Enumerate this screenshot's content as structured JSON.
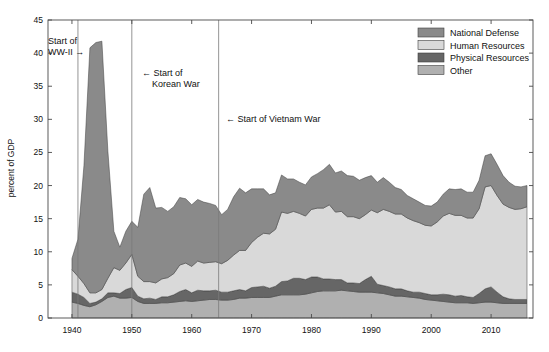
{
  "chart_data": {
    "type": "area",
    "stacked": true,
    "title": "",
    "xlabel": "",
    "ylabel": "percent of GDP",
    "xlim": [
      1936,
      2017
    ],
    "ylim": [
      0,
      45
    ],
    "xticks": [
      1940,
      1950,
      1960,
      1970,
      1980,
      1990,
      2000,
      2010
    ],
    "xtick_labels": [
      "1940",
      "1950",
      "1960",
      "1970",
      "1980",
      "1990",
      "2000",
      "2010"
    ],
    "yticks": [
      0,
      5,
      10,
      15,
      20,
      25,
      30,
      35,
      40,
      45
    ],
    "ytick_labels": [
      "0",
      "5",
      "10",
      "15",
      "20",
      "25",
      "30",
      "35",
      "40",
      "45"
    ],
    "grid": false,
    "legend_position": "top-right",
    "stack_order_bottom_to_top": [
      "Other",
      "Physical Resources",
      "Human Resources",
      "National Defense"
    ],
    "x": [
      1940,
      1941,
      1942,
      1943,
      1944,
      1945,
      1946,
      1947,
      1948,
      1949,
      1950,
      1951,
      1952,
      1953,
      1954,
      1955,
      1956,
      1957,
      1958,
      1959,
      1960,
      1961,
      1962,
      1963,
      1964,
      1965,
      1966,
      1967,
      1968,
      1969,
      1970,
      1971,
      1972,
      1973,
      1974,
      1975,
      1976,
      1977,
      1978,
      1979,
      1980,
      1981,
      1982,
      1983,
      1984,
      1985,
      1986,
      1987,
      1988,
      1989,
      1990,
      1991,
      1992,
      1993,
      1994,
      1995,
      1996,
      1997,
      1998,
      1999,
      2000,
      2001,
      2002,
      2003,
      2004,
      2005,
      2006,
      2007,
      2008,
      2009,
      2010,
      2011,
      2012,
      2013,
      2014,
      2015,
      2016
    ],
    "series": [
      {
        "name": "National Defense",
        "color": "#8a8a8a",
        "values": [
          1.7,
          5.6,
          17.8,
          37.0,
          37.8,
          37.5,
          19.2,
          5.5,
          3.5,
          4.8,
          5.0,
          7.4,
          13.2,
          14.2,
          11.3,
          10.8,
          10.0,
          10.1,
          10.2,
          9.7,
          9.3,
          9.3,
          9.2,
          8.9,
          8.5,
          7.4,
          7.7,
          8.8,
          9.4,
          8.7,
          8.1,
          7.3,
          6.7,
          5.9,
          5.5,
          5.6,
          5.2,
          4.9,
          4.7,
          4.7,
          4.9,
          5.2,
          5.8,
          6.1,
          5.9,
          6.1,
          6.2,
          6.1,
          5.8,
          5.6,
          5.2,
          4.6,
          4.8,
          4.4,
          4.0,
          3.7,
          3.4,
          3.3,
          3.1,
          3.0,
          3.0,
          3.0,
          3.3,
          3.7,
          3.9,
          4.0,
          3.9,
          3.9,
          4.3,
          4.7,
          4.8,
          4.7,
          4.3,
          3.8,
          3.5,
          3.3,
          3.2
        ]
      },
      {
        "name": "Human Resources",
        "color": "#d9d9d9",
        "values": [
          3.4,
          2.7,
          2.1,
          1.6,
          1.4,
          1.4,
          2.2,
          3.8,
          3.5,
          4.0,
          5.0,
          3.0,
          2.6,
          2.5,
          2.5,
          2.7,
          2.9,
          3.2,
          4.0,
          4.0,
          4.0,
          4.4,
          4.2,
          4.3,
          4.3,
          4.3,
          4.8,
          5.4,
          5.9,
          6.1,
          6.8,
          7.5,
          8.0,
          8.2,
          8.6,
          10.5,
          10.2,
          10.1,
          9.8,
          9.6,
          10.2,
          10.4,
          10.7,
          11.2,
          10.2,
          10.3,
          10.0,
          10.0,
          9.8,
          9.8,
          10.0,
          10.8,
          11.5,
          11.4,
          11.3,
          11.3,
          11.0,
          10.8,
          10.5,
          10.3,
          10.4,
          11.0,
          11.8,
          12.3,
          12.2,
          12.1,
          11.9,
          12.0,
          12.8,
          15.4,
          15.3,
          14.6,
          14.0,
          13.8,
          13.6,
          13.7,
          14.0
        ]
      },
      {
        "name": "Physical Resources",
        "color": "#666666",
        "values": [
          1.5,
          1.4,
          1.2,
          0.5,
          0.4,
          0.4,
          0.7,
          0.5,
          0.7,
          1.3,
          1.5,
          0.8,
          0.7,
          0.8,
          0.6,
          0.9,
          0.9,
          1.1,
          1.5,
          1.7,
          1.3,
          1.6,
          1.4,
          1.3,
          1.4,
          1.2,
          1.2,
          1.3,
          1.3,
          1.1,
          1.5,
          1.6,
          1.7,
          1.4,
          1.5,
          2.0,
          2.1,
          2.5,
          2.5,
          2.2,
          2.4,
          2.2,
          1.8,
          1.8,
          1.7,
          1.6,
          1.2,
          1.3,
          1.3,
          1.9,
          2.4,
          1.3,
          1.2,
          1.2,
          1.1,
          1.1,
          0.9,
          0.8,
          0.9,
          0.9,
          0.8,
          0.9,
          1.1,
          1.1,
          1.0,
          1.1,
          0.9,
          0.9,
          1.4,
          2.0,
          2.3,
          1.6,
          1.0,
          0.7,
          0.6,
          0.6,
          0.6
        ]
      },
      {
        "name": "Other",
        "color": "#b0b0b0",
        "values": [
          2.4,
          2.2,
          1.9,
          1.7,
          2.0,
          2.5,
          3.1,
          3.3,
          3.0,
          3.0,
          3.1,
          2.5,
          2.2,
          2.2,
          2.2,
          2.3,
          2.3,
          2.4,
          2.5,
          2.6,
          2.5,
          2.6,
          2.7,
          2.8,
          2.8,
          2.7,
          2.7,
          2.8,
          3.0,
          3.0,
          3.1,
          3.1,
          3.1,
          3.1,
          3.3,
          3.5,
          3.5,
          3.5,
          3.5,
          3.6,
          3.8,
          4.0,
          4.1,
          4.1,
          4.1,
          4.2,
          4.1,
          4.0,
          3.9,
          3.9,
          3.9,
          3.8,
          3.7,
          3.5,
          3.3,
          3.3,
          3.2,
          3.1,
          3.0,
          2.8,
          2.7,
          2.6,
          2.5,
          2.4,
          2.3,
          2.3,
          2.3,
          2.2,
          2.3,
          2.4,
          2.4,
          2.3,
          2.2,
          2.2,
          2.2,
          2.2,
          2.2
        ]
      }
    ],
    "annotations": [
      {
        "id": "ww2",
        "label_line1": "Start of",
        "label_line2": "WW-II →",
        "x_value": 1941,
        "arrow": "right"
      },
      {
        "id": "korea",
        "label_line1": "← Start of",
        "label_line2": "Korean War",
        "x_value": 1950,
        "arrow": "left"
      },
      {
        "id": "vietnam",
        "label_line1": "← Start of Vietnam War",
        "label_line2": "",
        "x_value": 1964.5,
        "arrow": "left"
      }
    ]
  },
  "legend": {
    "items": [
      {
        "label": "National Defense",
        "color": "#8a8a8a"
      },
      {
        "label": "Human Resources",
        "color": "#d9d9d9"
      },
      {
        "label": "Physical Resources",
        "color": "#666666"
      },
      {
        "label": "Other",
        "color": "#b0b0b0"
      }
    ]
  },
  "axes": {
    "y_title": "percent of GDP",
    "y_labels": [
      "45",
      "40",
      "35",
      "30",
      "25",
      "20",
      "15",
      "10",
      "5",
      "0"
    ],
    "x_labels": [
      "1940",
      "1950",
      "1960",
      "1970",
      "1980",
      "1990",
      "2000",
      "2010"
    ]
  },
  "colors": {
    "axis": "#4a4a4a",
    "text": "#111111",
    "background": "#ffffff",
    "war_line": "#7a7a7a"
  }
}
